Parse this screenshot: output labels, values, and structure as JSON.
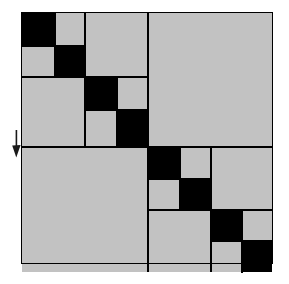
{
  "figure": {
    "width": 289,
    "height": 284
  },
  "colors": {
    "dark": "#000000",
    "light": "#c2c2c2",
    "background": "#ffffff",
    "border": "#000000",
    "marker": "#1a1a1a"
  },
  "matrix": {
    "origin_x": 22,
    "origin_y": 13,
    "size": 250,
    "outer_border_width": 1,
    "split_main_x": 147,
    "split_main_y": 146,
    "grid_line_width": 2
  },
  "legend": {
    "dark_meaning": "high value / dense sub-block",
    "light_meaning": "low value / sparse sub-block"
  },
  "marker": {
    "name": "down-arrow-marker",
    "label": "",
    "x": 10,
    "y": 130,
    "width": 12,
    "height": 28,
    "points_to_row": 146
  },
  "cells": [
    {
      "id": "q1-a-dark",
      "tone": "dark",
      "x": 22,
      "y": 13,
      "w": 33,
      "h": 33
    },
    {
      "id": "q1-b-light",
      "tone": "light",
      "x": 55,
      "y": 13,
      "w": 30,
      "h": 33
    },
    {
      "id": "q1-c-light",
      "tone": "light",
      "x": 22,
      "y": 46,
      "w": 33,
      "h": 31
    },
    {
      "id": "q1-d-dark",
      "tone": "dark",
      "x": 55,
      "y": 46,
      "w": 30,
      "h": 31
    },
    {
      "id": "q1-offdiag-top-light",
      "tone": "light",
      "x": 85,
      "y": 13,
      "w": 62,
      "h": 64
    },
    {
      "id": "q1-offdiag-left-light",
      "tone": "light",
      "x": 22,
      "y": 77,
      "w": 63,
      "h": 69
    },
    {
      "id": "q2-a-dark",
      "tone": "dark",
      "x": 85,
      "y": 77,
      "w": 32,
      "h": 33
    },
    {
      "id": "q2-b-light",
      "tone": "light",
      "x": 117,
      "y": 77,
      "w": 30,
      "h": 33
    },
    {
      "id": "q2-c-light",
      "tone": "light",
      "x": 85,
      "y": 110,
      "w": 32,
      "h": 36
    },
    {
      "id": "q2-d-dark",
      "tone": "dark",
      "x": 117,
      "y": 110,
      "w": 30,
      "h": 36
    },
    {
      "id": "top-right-block-light",
      "tone": "light",
      "x": 149,
      "y": 13,
      "w": 123,
      "h": 131
    },
    {
      "id": "bottom-left-block-light",
      "tone": "light",
      "x": 22,
      "y": 148,
      "w": 125,
      "h": 124
    },
    {
      "id": "q3-a-dark",
      "tone": "dark",
      "x": 149,
      "y": 148,
      "w": 31,
      "h": 31
    },
    {
      "id": "q3-b-light",
      "tone": "light",
      "x": 180,
      "y": 148,
      "w": 30,
      "h": 31
    },
    {
      "id": "q3-c-light",
      "tone": "light",
      "x": 149,
      "y": 179,
      "w": 31,
      "h": 30
    },
    {
      "id": "q3-d-dark",
      "tone": "dark",
      "x": 180,
      "y": 179,
      "w": 30,
      "h": 30
    },
    {
      "id": "q3-offdiag-right-light",
      "tone": "light",
      "x": 212,
      "y": 148,
      "w": 60,
      "h": 61
    },
    {
      "id": "q3-offdiag-bottom-light",
      "tone": "light",
      "x": 149,
      "y": 211,
      "w": 61,
      "h": 61
    },
    {
      "id": "q4-a-dark",
      "tone": "dark",
      "x": 212,
      "y": 211,
      "w": 30,
      "h": 30
    },
    {
      "id": "q4-b-light",
      "tone": "light",
      "x": 242,
      "y": 211,
      "w": 30,
      "h": 30
    },
    {
      "id": "q4-c-light",
      "tone": "light",
      "x": 212,
      "y": 241,
      "w": 30,
      "h": 31
    },
    {
      "id": "q4-d-dark",
      "tone": "dark",
      "x": 242,
      "y": 241,
      "w": 30,
      "h": 31
    }
  ],
  "separators": [
    {
      "id": "main-vertical",
      "orientation": "vertical",
      "x": 147,
      "y": 13,
      "len": 259,
      "thickness": 2
    },
    {
      "id": "main-horizontal",
      "orientation": "horizontal",
      "x": 22,
      "y": 146,
      "len": 250,
      "thickness": 2
    },
    {
      "id": "q1-q2-horizontal",
      "orientation": "horizontal",
      "x": 22,
      "y": 76,
      "len": 125,
      "thickness": 2
    },
    {
      "id": "q1-q2-vertical",
      "orientation": "vertical",
      "x": 84,
      "y": 13,
      "len": 133,
      "thickness": 2
    },
    {
      "id": "q3-q4-vertical",
      "orientation": "vertical",
      "x": 210,
      "y": 146,
      "len": 126,
      "thickness": 2
    },
    {
      "id": "q3-q4-horizontal",
      "orientation": "horizontal",
      "x": 147,
      "y": 209,
      "len": 125,
      "thickness": 2
    },
    {
      "id": "q1-inner-vertical",
      "orientation": "vertical",
      "x": 54,
      "y": 13,
      "len": 64,
      "thickness": 2
    },
    {
      "id": "q1-inner-horizontal",
      "orientation": "horizontal",
      "x": 22,
      "y": 45,
      "len": 63,
      "thickness": 2
    },
    {
      "id": "q2-inner-vertical",
      "orientation": "vertical",
      "x": 116,
      "y": 76,
      "len": 70,
      "thickness": 2
    },
    {
      "id": "q2-inner-horizontal",
      "orientation": "horizontal",
      "x": 84,
      "y": 109,
      "len": 63,
      "thickness": 2
    },
    {
      "id": "q3-inner-vertical",
      "orientation": "vertical",
      "x": 179,
      "y": 146,
      "len": 64,
      "thickness": 2
    },
    {
      "id": "q3-inner-horizontal",
      "orientation": "horizontal",
      "x": 147,
      "y": 178,
      "len": 63,
      "thickness": 2
    },
    {
      "id": "q4-inner-vertical",
      "orientation": "vertical",
      "x": 241,
      "y": 209,
      "len": 64,
      "thickness": 2
    },
    {
      "id": "q4-inner-horizontal",
      "orientation": "horizontal",
      "x": 210,
      "y": 240,
      "len": 62,
      "thickness": 2
    }
  ]
}
